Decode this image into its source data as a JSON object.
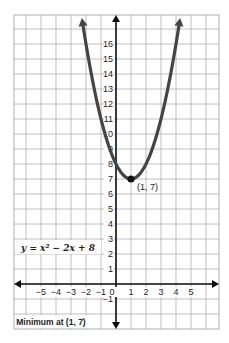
{
  "chart_data": {
    "type": "line",
    "title": "",
    "xlabel": "",
    "ylabel": "",
    "function": "y = x^2 - 2x + 8",
    "equation_label": "y = x² − 2x + 8",
    "annotation_label": "Minimum at (1, 7)",
    "vertex": {
      "x": 1,
      "y": 7,
      "label": "(1, 7)"
    },
    "x": [
      -2,
      -1,
      0,
      1,
      2,
      3,
      4
    ],
    "y": [
      16,
      11,
      8,
      7,
      8,
      11,
      16
    ],
    "x_ticks": [
      "−5",
      "−4",
      "−3",
      "−2",
      "−1",
      "0",
      "1",
      "2",
      "3",
      "4",
      "5"
    ],
    "y_ticks": [
      "−1",
      "1",
      "2",
      "3",
      "4",
      "5",
      "6",
      "7",
      "8",
      "9",
      "10",
      "11",
      "12",
      "13",
      "14",
      "15",
      "16"
    ],
    "xlim": [
      -6.9,
      7
    ],
    "ylim": [
      -3,
      17.9
    ],
    "grid": true,
    "curve_color": "#444444",
    "grid_color": "#b0b0b0",
    "axis_color": "#111111"
  }
}
